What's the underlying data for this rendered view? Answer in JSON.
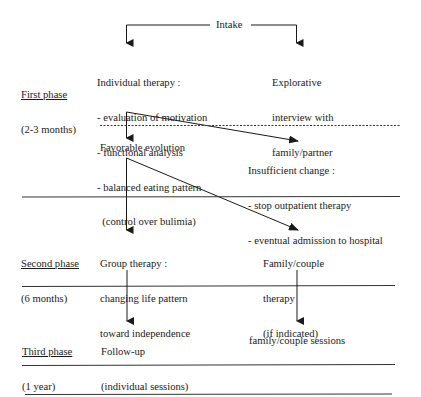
{
  "diagram": {
    "type": "flowchart",
    "start": {
      "label": "Intake"
    },
    "phases": [
      {
        "name": "First phase",
        "duration": "(2-3 months)"
      },
      {
        "name": "Second phase",
        "duration": "(6 months)"
      },
      {
        "name": "Third phase",
        "duration": "(1 year)"
      }
    ],
    "nodes": {
      "individual_therapy": {
        "title": "Individual therapy :",
        "items": [
          "- evaluation of motivation",
          "- functional analysis",
          "- balanced eating pattern",
          "  (control over bulimia)"
        ]
      },
      "explorative_interview": {
        "lines": [
          "Explorative",
          "interview with",
          "family/partner"
        ]
      },
      "favorable_evolution": {
        "label": "Favorable evolution"
      },
      "insufficient_change": {
        "title": "Insufficient change :",
        "items": [
          "- stop outpatient therapy",
          "- eventual admission to hospital"
        ]
      },
      "group_therapy": {
        "lines": [
          "Group therapy :",
          "changing life pattern",
          "toward independence"
        ]
      },
      "family_couple_therapy": {
        "lines": [
          "Family/couple",
          "therapy",
          "(if indicated)"
        ]
      },
      "follow_up": {
        "lines": [
          "Follow-up",
          "(individual sessions)"
        ]
      },
      "family_couple_sessions": {
        "label": "family/couple sessions"
      }
    },
    "edges": [
      [
        "Intake",
        "Individual therapy"
      ],
      [
        "Intake",
        "Explorative interview with family/partner"
      ],
      [
        "Individual therapy",
        "Favorable evolution"
      ],
      [
        "Individual therapy",
        "Insufficient change"
      ],
      [
        "Favorable evolution",
        "Group therapy"
      ],
      [
        "Favorable evolution",
        "Family/couple therapy"
      ],
      [
        "Group therapy",
        "Follow-up"
      ],
      [
        "Family/couple therapy",
        "family/couple sessions"
      ]
    ],
    "colors": {
      "ink": "#1a1a1a",
      "background": "#ffffff"
    }
  }
}
